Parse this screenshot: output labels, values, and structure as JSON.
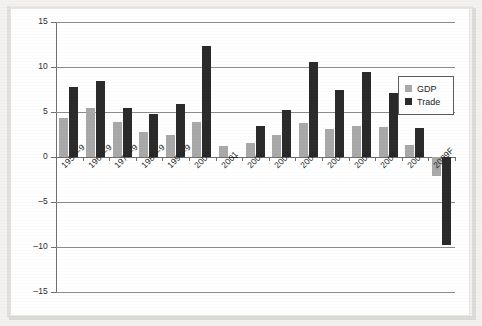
{
  "chart_data": {
    "type": "bar",
    "title": "",
    "subtitle": "",
    "xlabel": "",
    "ylabel": "",
    "ylim": [
      -15,
      15
    ],
    "yticks": [
      15,
      10,
      5,
      0,
      -5,
      -10,
      -15
    ],
    "ytick_labels": [
      "15",
      "10",
      "5",
      "0",
      "–5",
      "–10",
      "–15"
    ],
    "grid": true,
    "legend_position": "right",
    "categories": [
      "1950–9",
      "1960–9",
      "1970–9",
      "1980–9",
      "1990–9",
      "2000",
      "2001",
      "2002",
      "2003",
      "2004",
      "2005",
      "2006",
      "2007",
      "2008",
      "2009F"
    ],
    "series": [
      {
        "name": "GDP",
        "color": "#a9a9a9",
        "values": [
          4.3,
          5.4,
          3.9,
          2.8,
          2.5,
          3.9,
          1.2,
          1.6,
          2.4,
          3.8,
          3.1,
          3.5,
          3.3,
          1.3,
          -2.1
        ]
      },
      {
        "name": "Trade",
        "color": "#2b2b2b",
        "values": [
          7.8,
          8.5,
          5.4,
          4.8,
          5.9,
          12.3,
          -0.1,
          3.5,
          5.2,
          10.6,
          7.4,
          9.4,
          7.1,
          3.2,
          -9.8
        ]
      }
    ]
  },
  "legend": {
    "items": [
      {
        "label": "GDP",
        "color": "#a9a9a9"
      },
      {
        "label": "Trade",
        "color": "#2b2b2b"
      }
    ]
  },
  "colors": {
    "gdp": "#a9a9a9",
    "trade": "#2b2b2b",
    "axis": "#6f6f6f",
    "grid": "#8d8d8d",
    "page": "#f3f2f0",
    "plot_background": "#ffffff"
  }
}
